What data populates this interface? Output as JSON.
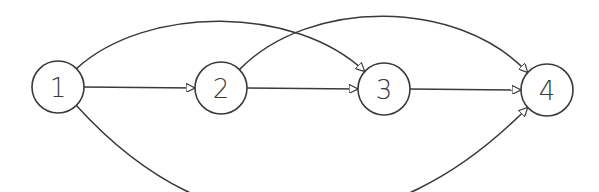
{
  "diagram": {
    "type": "directed-graph",
    "nodes": [
      {
        "id": "1",
        "label": "1"
      },
      {
        "id": "2",
        "label": "2"
      },
      {
        "id": "3",
        "label": "3"
      },
      {
        "id": "4",
        "label": "4"
      }
    ],
    "edges": [
      {
        "from": "1",
        "to": "2",
        "style": "straight"
      },
      {
        "from": "2",
        "to": "3",
        "style": "straight"
      },
      {
        "from": "3",
        "to": "4",
        "style": "straight"
      },
      {
        "from": "1",
        "to": "3",
        "style": "arc-above"
      },
      {
        "from": "2",
        "to": "4",
        "style": "arc-above"
      },
      {
        "from": "1",
        "to": "4",
        "style": "arc-below"
      }
    ],
    "colors": {
      "stroke": "#3a3a3a",
      "background": "#ffffff"
    }
  }
}
